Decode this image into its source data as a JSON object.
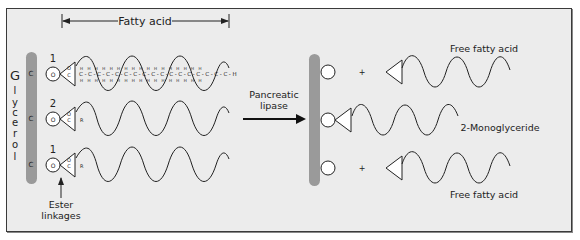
{
  "diagram": {
    "left": {
      "bracket_label": "Fatty acid",
      "backbone_label": [
        "G",
        "l",
        "y",
        "c",
        "e",
        "r",
        "o",
        "l"
      ],
      "carbon_label": "C",
      "positions": [
        "1",
        "2",
        "1"
      ],
      "ester_label_line1": "Ester",
      "ester_label_line2": "linkages",
      "chain_atom": "C",
      "chain_h": "H",
      "chain_o": "O",
      "chain_r": "R"
    },
    "arrow": {
      "label_line1": "Pancreatic",
      "label_line2": "lipase"
    },
    "right": {
      "products": [
        {
          "label": "Free fatty acid",
          "plus": "+"
        },
        {
          "label": "2-Monoglyceride"
        },
        {
          "label": "Free fatty acid",
          "plus": "+"
        }
      ]
    },
    "colors": {
      "background": "#ececec",
      "border": "#3a3a3a",
      "glycerol_bar": "#9a9a9a",
      "line": "#222222"
    }
  }
}
